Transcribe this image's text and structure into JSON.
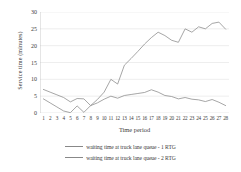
{
  "chart_data": {
    "type": "line",
    "title": "",
    "xlabel": "Time period",
    "ylabel": "Service time (minutes)",
    "ylim": [
      0,
      30
    ],
    "ytick_values": [
      30,
      25,
      20,
      15,
      10,
      5,
      0
    ],
    "yticks": [
      "30",
      "25",
      "20",
      "15",
      "10",
      "5",
      "0"
    ],
    "grid": "horizontal",
    "legend_position": "bottom",
    "categories": [
      "1",
      "2",
      "3",
      "4",
      "5",
      "6",
      "7",
      "8",
      "9",
      "10",
      "11",
      "12",
      "13",
      "14",
      "15",
      "16",
      "17",
      "18",
      "19",
      "20",
      "21",
      "22",
      "23",
      "24",
      "25",
      "26",
      "27",
      "28"
    ],
    "x": [
      1,
      2,
      3,
      4,
      5,
      6,
      7,
      8,
      9,
      10,
      11,
      12,
      13,
      14,
      15,
      16,
      17,
      18,
      19,
      20,
      21,
      22,
      23,
      24,
      25,
      26,
      27,
      28
    ],
    "series": [
      {
        "name": "waiting time at truck lane queue - 1 RTG",
        "color": "#888888",
        "values": [
          4.2,
          3.0,
          1.8,
          0.6,
          0.1,
          2.1,
          0.2,
          2.2,
          4.0,
          6.2,
          10.0,
          8.6,
          14.2,
          16.2,
          18.3,
          20.5,
          22.4,
          24.0,
          23.0,
          21.6,
          21.0,
          25.0,
          24.0,
          25.6,
          25.0,
          26.6,
          27.0,
          24.9
        ]
      },
      {
        "name": "waiting time at truck lane queue - 2 RTG",
        "color": "#888888",
        "values": [
          7.0,
          6.2,
          5.4,
          4.6,
          3.3,
          4.3,
          4.2,
          2.2,
          3.0,
          4.1,
          5.0,
          4.4,
          5.2,
          5.5,
          5.8,
          6.1,
          6.9,
          6.2,
          5.2,
          4.9,
          4.2,
          4.6,
          4.1,
          3.9,
          3.4,
          4.0,
          3.2,
          2.2
        ]
      }
    ],
    "legend": [
      "waiting time at truck lane queue - 1 RTG",
      "waiting time at truck lane queue - 2 RTG"
    ],
    "colors": {
      "line": "#888888",
      "gridline": "#e3e3e3",
      "axis": "#b5b5b5",
      "text": "#3b3b3b",
      "background": "#ffffff"
    }
  }
}
